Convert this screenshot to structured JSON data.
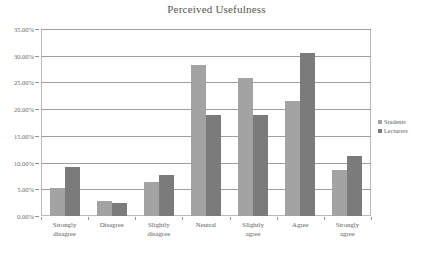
{
  "chart_data": {
    "type": "bar",
    "title": "Perceived Usefulness",
    "xlabel": "",
    "ylabel": "",
    "ylim": [
      0,
      35
    ],
    "ytick_step": 5,
    "ytick_labels": [
      "0.00%",
      "5.00%",
      "10.00%",
      "15.00%",
      "20.00%",
      "25.00%",
      "30.00%",
      "35.00%"
    ],
    "ytick_values": [
      0,
      5,
      10,
      15,
      20,
      25,
      30,
      35
    ],
    "grid": true,
    "legend_position": "right",
    "categories": [
      "Strongly disagree",
      "Disagree",
      "Slightly disagree",
      "Neutral",
      "Slightly agree",
      "Agree",
      "Strongly agree"
    ],
    "category_lines": [
      [
        "Strongly",
        "disagree"
      ],
      [
        "Disagree"
      ],
      [
        "Slightly",
        "disagree"
      ],
      [
        "Neutral"
      ],
      [
        "Slightly",
        "agree"
      ],
      [
        "Agree"
      ],
      [
        "Strongly",
        "agree"
      ]
    ],
    "series": [
      {
        "name": "Students",
        "color": "#a3a3a3",
        "values": [
          5.2,
          2.9,
          6.4,
          28.2,
          25.8,
          21.6,
          8.7
        ]
      },
      {
        "name": "Lecturers",
        "color": "#7b7b7b",
        "values": [
          9.2,
          2.4,
          7.6,
          19.0,
          19.0,
          30.6,
          11.3
        ]
      }
    ]
  },
  "legend": {
    "items": [
      {
        "label": "Students",
        "marker": "square-swatch-light"
      },
      {
        "label": "Lecturers",
        "marker": "square-swatch-dark"
      }
    ]
  },
  "colors": {
    "students": "#a3a3a3",
    "lecturers": "#7b7b7b",
    "gridline": "#9f9f9f",
    "border": "#b9b9b9",
    "text": "#5e5e5e",
    "background": "#ffffff"
  }
}
